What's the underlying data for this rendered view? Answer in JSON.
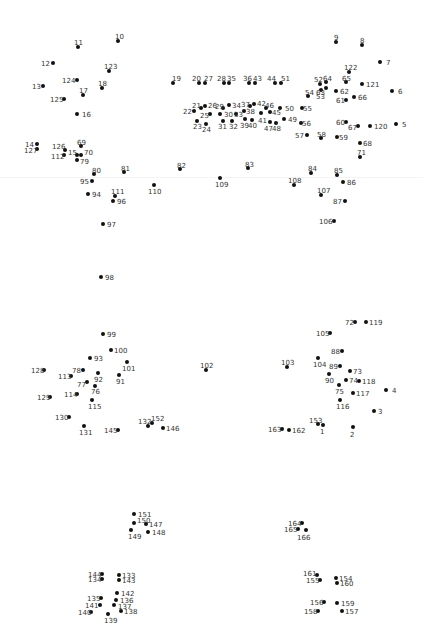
{
  "puzzle": {
    "title": "",
    "dot_color": "#111111",
    "label_color": "#333333",
    "points": [
      {
        "n": "1",
        "x": 323,
        "y": 425,
        "lx": 320,
        "ly": 428
      },
      {
        "n": "2",
        "x": 353,
        "y": 427,
        "lx": 350,
        "ly": 431
      },
      {
        "n": "3",
        "x": 374,
        "y": 411,
        "lx": 378,
        "ly": 408
      },
      {
        "n": "4",
        "x": 386,
        "y": 390,
        "lx": 392,
        "ly": 387
      },
      {
        "n": "5",
        "x": 396,
        "y": 124,
        "lx": 402,
        "ly": 121
      },
      {
        "n": "6",
        "x": 392,
        "y": 91,
        "lx": 398,
        "ly": 88
      },
      {
        "n": "7",
        "x": 380,
        "y": 62,
        "lx": 386,
        "ly": 59
      },
      {
        "n": "8",
        "x": 362,
        "y": 45,
        "lx": 360,
        "ly": 37
      },
      {
        "n": "9",
        "x": 336,
        "y": 42,
        "lx": 334,
        "ly": 34
      },
      {
        "n": "10",
        "x": 118,
        "y": 41,
        "lx": 115,
        "ly": 33
      },
      {
        "n": "11",
        "x": 78,
        "y": 47,
        "lx": 74,
        "ly": 39
      },
      {
        "n": "12",
        "x": 53,
        "y": 63,
        "lx": 41,
        "ly": 60
      },
      {
        "n": "13",
        "x": 43,
        "y": 86,
        "lx": 32,
        "ly": 83
      },
      {
        "n": "14",
        "x": 37,
        "y": 144,
        "lx": 25,
        "ly": 141
      },
      {
        "n": "15",
        "x": 77,
        "y": 155,
        "lx": 68,
        "ly": 149
      },
      {
        "n": "16",
        "x": 77,
        "y": 114,
        "lx": 82,
        "ly": 111
      },
      {
        "n": "17",
        "x": 83,
        "y": 95,
        "lx": 79,
        "ly": 87
      },
      {
        "n": "18",
        "x": 102,
        "y": 88,
        "lx": 98,
        "ly": 80
      },
      {
        "n": "19",
        "x": 173,
        "y": 83,
        "lx": 172,
        "ly": 75
      },
      {
        "n": "20",
        "x": 199,
        "y": 83,
        "lx": 192,
        "ly": 75
      },
      {
        "n": "21",
        "x": 201,
        "y": 108,
        "lx": 192,
        "ly": 102
      },
      {
        "n": "22",
        "x": 194,
        "y": 111,
        "lx": 183,
        "ly": 108
      },
      {
        "n": "23",
        "x": 197,
        "y": 121,
        "lx": 193,
        "ly": 123
      },
      {
        "n": "24",
        "x": 206,
        "y": 124,
        "lx": 202,
        "ly": 126
      },
      {
        "n": "25",
        "x": 210,
        "y": 114,
        "lx": 200,
        "ly": 112
      },
      {
        "n": "26",
        "x": 205,
        "y": 106,
        "lx": 208,
        "ly": 102
      },
      {
        "n": "27",
        "x": 205,
        "y": 83,
        "lx": 204,
        "ly": 75
      },
      {
        "n": "28",
        "x": 224,
        "y": 83,
        "lx": 217,
        "ly": 75
      },
      {
        "n": "29",
        "x": 223,
        "y": 108,
        "lx": 215,
        "ly": 103
      },
      {
        "n": "30",
        "x": 220,
        "y": 114,
        "lx": 224,
        "ly": 111
      },
      {
        "n": "31",
        "x": 223,
        "y": 121,
        "lx": 218,
        "ly": 123
      },
      {
        "n": "32",
        "x": 232,
        "y": 121,
        "lx": 229,
        "ly": 123
      },
      {
        "n": "33",
        "x": 236,
        "y": 114,
        "lx": 234,
        "ly": 111
      },
      {
        "n": "34",
        "x": 229,
        "y": 105,
        "lx": 232,
        "ly": 102
      },
      {
        "n": "35",
        "x": 229,
        "y": 83,
        "lx": 227,
        "ly": 75
      },
      {
        "n": "36",
        "x": 249,
        "y": 83,
        "lx": 243,
        "ly": 75
      },
      {
        "n": "37",
        "x": 250,
        "y": 106,
        "lx": 241,
        "ly": 101
      },
      {
        "n": "38",
        "x": 244,
        "y": 111,
        "lx": 246,
        "ly": 108
      },
      {
        "n": "39",
        "x": 245,
        "y": 119,
        "lx": 240,
        "ly": 122
      },
      {
        "n": "40",
        "x": 252,
        "y": 120,
        "lx": 248,
        "ly": 122
      },
      {
        "n": "41",
        "x": 261,
        "y": 113,
        "lx": 258,
        "ly": 117
      },
      {
        "n": "42",
        "x": 254,
        "y": 104,
        "lx": 257,
        "ly": 100
      },
      {
        "n": "43",
        "x": 255,
        "y": 83,
        "lx": 253,
        "ly": 75
      },
      {
        "n": "44",
        "x": 275,
        "y": 83,
        "lx": 267,
        "ly": 75
      },
      {
        "n": "45",
        "x": 270,
        "y": 112,
        "lx": 272,
        "ly": 109
      },
      {
        "n": "46",
        "x": 266,
        "y": 108,
        "lx": 265,
        "ly": 102
      },
      {
        "n": "47",
        "x": 270,
        "y": 122,
        "lx": 264,
        "ly": 125
      },
      {
        "n": "48",
        "x": 276,
        "y": 123,
        "lx": 272,
        "ly": 125
      },
      {
        "n": "49",
        "x": 284,
        "y": 119,
        "lx": 288,
        "ly": 116
      },
      {
        "n": "50",
        "x": 280,
        "y": 108,
        "lx": 285,
        "ly": 105
      },
      {
        "n": "51",
        "x": 281,
        "y": 83,
        "lx": 281,
        "ly": 75
      },
      {
        "n": "52",
        "x": 320,
        "y": 84,
        "lx": 314,
        "ly": 76
      },
      {
        "n": "53",
        "x": 321,
        "y": 90,
        "lx": 316,
        "ly": 93
      },
      {
        "n": "54",
        "x": 308,
        "y": 96,
        "lx": 305,
        "ly": 89
      },
      {
        "n": "55",
        "x": 302,
        "y": 108,
        "lx": 303,
        "ly": 105
      },
      {
        "n": "56",
        "x": 301,
        "y": 123,
        "lx": 302,
        "ly": 120
      },
      {
        "n": "57",
        "x": 307,
        "y": 135,
        "lx": 295,
        "ly": 132
      },
      {
        "n": "58",
        "x": 321,
        "y": 138,
        "lx": 317,
        "ly": 131
      },
      {
        "n": "59",
        "x": 337,
        "y": 137,
        "lx": 339,
        "ly": 134
      },
      {
        "n": "60",
        "x": 346,
        "y": 122,
        "lx": 336,
        "ly": 119
      },
      {
        "n": "61",
        "x": 346,
        "y": 100,
        "lx": 336,
        "ly": 97
      },
      {
        "n": "62",
        "x": 336,
        "y": 91,
        "lx": 340,
        "ly": 88
      },
      {
        "n": "63",
        "x": 326,
        "y": 88,
        "lx": 316,
        "ly": 89
      },
      {
        "n": "64",
        "x": 326,
        "y": 82,
        "lx": 323,
        "ly": 75
      },
      {
        "n": "65",
        "x": 346,
        "y": 82,
        "lx": 342,
        "ly": 75
      },
      {
        "n": "66",
        "x": 354,
        "y": 97,
        "lx": 358,
        "ly": 94
      },
      {
        "n": "67",
        "x": 358,
        "y": 126,
        "lx": 348,
        "ly": 124
      },
      {
        "n": "68",
        "x": 360,
        "y": 143,
        "lx": 363,
        "ly": 140
      },
      {
        "n": "69",
        "x": 81,
        "y": 146,
        "lx": 77,
        "ly": 139
      },
      {
        "n": "70",
        "x": 81,
        "y": 155,
        "lx": 84,
        "ly": 149
      },
      {
        "n": "71",
        "x": 360,
        "y": 157,
        "lx": 357,
        "ly": 149
      },
      {
        "n": "72",
        "x": 355,
        "y": 322,
        "lx": 345,
        "ly": 319
      },
      {
        "n": "73",
        "x": 350,
        "y": 371,
        "lx": 353,
        "ly": 368
      },
      {
        "n": "74",
        "x": 346,
        "y": 380,
        "lx": 349,
        "ly": 377
      },
      {
        "n": "75",
        "x": 339,
        "y": 385,
        "lx": 335,
        "ly": 388
      },
      {
        "n": "76",
        "x": 95,
        "y": 386,
        "lx": 91,
        "ly": 388
      },
      {
        "n": "77",
        "x": 87,
        "y": 382,
        "lx": 77,
        "ly": 381
      },
      {
        "n": "78",
        "x": 83,
        "y": 370,
        "lx": 72,
        "ly": 367
      },
      {
        "n": "79",
        "x": 77,
        "y": 160,
        "lx": 80,
        "ly": 158
      },
      {
        "n": "80",
        "x": 94,
        "y": 174,
        "lx": 92,
        "ly": 167
      },
      {
        "n": "81",
        "x": 124,
        "y": 172,
        "lx": 121,
        "ly": 165
      },
      {
        "n": "82",
        "x": 180,
        "y": 169,
        "lx": 177,
        "ly": 162
      },
      {
        "n": "83",
        "x": 248,
        "y": 168,
        "lx": 245,
        "ly": 161
      },
      {
        "n": "84",
        "x": 311,
        "y": 173,
        "lx": 308,
        "ly": 165
      },
      {
        "n": "85",
        "x": 337,
        "y": 175,
        "lx": 334,
        "ly": 167
      },
      {
        "n": "86",
        "x": 343,
        "y": 182,
        "lx": 347,
        "ly": 179
      },
      {
        "n": "87",
        "x": 345,
        "y": 201,
        "lx": 333,
        "ly": 198
      },
      {
        "n": "88",
        "x": 342,
        "y": 351,
        "lx": 331,
        "ly": 348
      },
      {
        "n": "89",
        "x": 340,
        "y": 366,
        "lx": 329,
        "ly": 363
      },
      {
        "n": "90",
        "x": 329,
        "y": 374,
        "lx": 325,
        "ly": 377
      },
      {
        "n": "91",
        "x": 119,
        "y": 375,
        "lx": 116,
        "ly": 378
      },
      {
        "n": "92",
        "x": 98,
        "y": 373,
        "lx": 94,
        "ly": 376
      },
      {
        "n": "93",
        "x": 90,
        "y": 358,
        "lx": 94,
        "ly": 355
      },
      {
        "n": "94",
        "x": 88,
        "y": 194,
        "lx": 92,
        "ly": 191
      },
      {
        "n": "95",
        "x": 92,
        "y": 181,
        "lx": 80,
        "ly": 178
      },
      {
        "n": "96",
        "x": 113,
        "y": 201,
        "lx": 117,
        "ly": 198
      },
      {
        "n": "97",
        "x": 103,
        "y": 224,
        "lx": 107,
        "ly": 221
      },
      {
        "n": "98",
        "x": 101,
        "y": 277,
        "lx": 105,
        "ly": 274
      },
      {
        "n": "99",
        "x": 103,
        "y": 334,
        "lx": 107,
        "ly": 331
      },
      {
        "n": "100",
        "x": 111,
        "y": 350,
        "lx": 114,
        "ly": 347
      },
      {
        "n": "101",
        "x": 127,
        "y": 362,
        "lx": 122,
        "ly": 365
      },
      {
        "n": "102",
        "x": 206,
        "y": 370,
        "lx": 200,
        "ly": 362
      },
      {
        "n": "103",
        "x": 287,
        "y": 367,
        "lx": 281,
        "ly": 359
      },
      {
        "n": "104",
        "x": 318,
        "y": 358,
        "lx": 313,
        "ly": 361
      },
      {
        "n": "105",
        "x": 330,
        "y": 333,
        "lx": 316,
        "ly": 330
      },
      {
        "n": "106",
        "x": 334,
        "y": 221,
        "lx": 319,
        "ly": 218
      },
      {
        "n": "107",
        "x": 321,
        "y": 195,
        "lx": 317,
        "ly": 187
      },
      {
        "n": "108",
        "x": 294,
        "y": 185,
        "lx": 288,
        "ly": 177
      },
      {
        "n": "109",
        "x": 220,
        "y": 178,
        "lx": 215,
        "ly": 181
      },
      {
        "n": "110",
        "x": 154,
        "y": 185,
        "lx": 148,
        "ly": 188
      },
      {
        "n": "111",
        "x": 115,
        "y": 196,
        "lx": 111,
        "ly": 188
      },
      {
        "n": "112",
        "x": 64,
        "y": 155,
        "lx": 51,
        "ly": 153
      },
      {
        "n": "113",
        "x": 71,
        "y": 376,
        "lx": 58,
        "ly": 373
      },
      {
        "n": "114",
        "x": 77,
        "y": 394,
        "lx": 64,
        "ly": 391
      },
      {
        "n": "115",
        "x": 92,
        "y": 400,
        "lx": 88,
        "ly": 403
      },
      {
        "n": "116",
        "x": 340,
        "y": 400,
        "lx": 336,
        "ly": 403
      },
      {
        "n": "117",
        "x": 353,
        "y": 393,
        "lx": 356,
        "ly": 390
      },
      {
        "n": "118",
        "x": 359,
        "y": 381,
        "lx": 362,
        "ly": 378
      },
      {
        "n": "119",
        "x": 366,
        "y": 322,
        "lx": 369,
        "ly": 319
      },
      {
        "n": "120",
        "x": 370,
        "y": 126,
        "lx": 374,
        "ly": 123
      },
      {
        "n": "121",
        "x": 362,
        "y": 84,
        "lx": 366,
        "ly": 81
      },
      {
        "n": "122",
        "x": 349,
        "y": 72,
        "lx": 344,
        "ly": 64
      },
      {
        "n": "123",
        "x": 109,
        "y": 71,
        "lx": 104,
        "ly": 63
      },
      {
        "n": "124",
        "x": 77,
        "y": 80,
        "lx": 62,
        "ly": 77
      },
      {
        "n": "125",
        "x": 64,
        "y": 99,
        "lx": 50,
        "ly": 96
      },
      {
        "n": "126",
        "x": 65,
        "y": 150,
        "lx": 52,
        "ly": 143
      },
      {
        "n": "127",
        "x": 37,
        "y": 149,
        "lx": 24,
        "ly": 147
      },
      {
        "n": "128",
        "x": 44,
        "y": 370,
        "lx": 31,
        "ly": 367
      },
      {
        "n": "129",
        "x": 50,
        "y": 397,
        "lx": 37,
        "ly": 394
      },
      {
        "n": "130",
        "x": 69,
        "y": 417,
        "lx": 55,
        "ly": 414
      },
      {
        "n": "131",
        "x": 84,
        "y": 426,
        "lx": 79,
        "ly": 429
      },
      {
        "n": "132",
        "x": 148,
        "y": 426,
        "lx": 138,
        "ly": 418
      },
      {
        "n": "133",
        "x": 119,
        "y": 575,
        "lx": 122,
        "ly": 572
      },
      {
        "n": "134",
        "x": 102,
        "y": 579,
        "lx": 88,
        "ly": 576
      },
      {
        "n": "135",
        "x": 101,
        "y": 598,
        "lx": 87,
        "ly": 595
      },
      {
        "n": "136",
        "x": 116,
        "y": 600,
        "lx": 120,
        "ly": 597
      },
      {
        "n": "137",
        "x": 114,
        "y": 605,
        "lx": 118,
        "ly": 603
      },
      {
        "n": "138",
        "x": 121,
        "y": 611,
        "lx": 124,
        "ly": 608
      },
      {
        "n": "139",
        "x": 108,
        "y": 614,
        "lx": 104,
        "ly": 617
      },
      {
        "n": "140",
        "x": 91,
        "y": 612,
        "lx": 78,
        "ly": 609
      },
      {
        "n": "141",
        "x": 100,
        "y": 605,
        "lx": 85,
        "ly": 602
      },
      {
        "n": "142",
        "x": 117,
        "y": 593,
        "lx": 121,
        "ly": 590
      },
      {
        "n": "143",
        "x": 119,
        "y": 580,
        "lx": 122,
        "ly": 577
      },
      {
        "n": "144",
        "x": 102,
        "y": 574,
        "lx": 88,
        "ly": 571
      },
      {
        "n": "145",
        "x": 118,
        "y": 430,
        "lx": 104,
        "ly": 427
      },
      {
        "n": "146",
        "x": 163,
        "y": 428,
        "lx": 166,
        "ly": 425
      },
      {
        "n": "147",
        "x": 146,
        "y": 524,
        "lx": 149,
        "ly": 521
      },
      {
        "n": "148",
        "x": 148,
        "y": 532,
        "lx": 152,
        "ly": 529
      },
      {
        "n": "149",
        "x": 131,
        "y": 530,
        "lx": 128,
        "ly": 533
      },
      {
        "n": "150",
        "x": 134,
        "y": 523,
        "lx": 137,
        "ly": 517
      },
      {
        "n": "151",
        "x": 134,
        "y": 514,
        "lx": 138,
        "ly": 511
      },
      {
        "n": "152",
        "x": 152,
        "y": 423,
        "lx": 151,
        "ly": 415
      },
      {
        "n": "153",
        "x": 318,
        "y": 424,
        "lx": 309,
        "ly": 417
      },
      {
        "n": "154",
        "x": 336,
        "y": 578,
        "lx": 339,
        "ly": 575
      },
      {
        "n": "155",
        "x": 320,
        "y": 580,
        "lx": 306,
        "ly": 577
      },
      {
        "n": "156",
        "x": 324,
        "y": 602,
        "lx": 310,
        "ly": 599
      },
      {
        "n": "157",
        "x": 342,
        "y": 611,
        "lx": 345,
        "ly": 608
      },
      {
        "n": "158",
        "x": 318,
        "y": 611,
        "lx": 304,
        "ly": 608
      },
      {
        "n": "159",
        "x": 337,
        "y": 603,
        "lx": 341,
        "ly": 600
      },
      {
        "n": "160",
        "x": 337,
        "y": 583,
        "lx": 340,
        "ly": 580
      },
      {
        "n": "161",
        "x": 317,
        "y": 575,
        "lx": 303,
        "ly": 570
      },
      {
        "n": "162",
        "x": 289,
        "y": 430,
        "lx": 292,
        "ly": 427
      },
      {
        "n": "163",
        "x": 282,
        "y": 429,
        "lx": 268,
        "ly": 426
      },
      {
        "n": "164",
        "x": 302,
        "y": 523,
        "lx": 288,
        "ly": 520
      },
      {
        "n": "165",
        "x": 298,
        "y": 529,
        "lx": 284,
        "ly": 526
      },
      {
        "n": "166",
        "x": 306,
        "y": 530,
        "lx": 297,
        "ly": 534
      }
    ]
  }
}
